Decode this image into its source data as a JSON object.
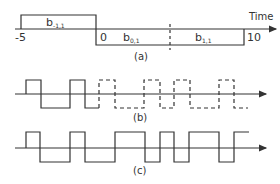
{
  "panel_a": {
    "caption": "(a)",
    "axis_label": "Time",
    "ticks": [
      {
        "label": "-5",
        "value": -5
      },
      {
        "label": "0",
        "value": 0
      },
      {
        "label": "10",
        "value": 10
      }
    ],
    "pulses": [
      {
        "name": "b",
        "sub": "-1,1",
        "level": "high",
        "from": -5,
        "to": 0
      },
      {
        "name": "b",
        "sub": "0,1",
        "level": "low",
        "from": 0,
        "to": 5
      },
      {
        "name": "b",
        "sub": "1,1",
        "level": "low",
        "from": 5,
        "to": 10
      }
    ],
    "dashed_marker_at": 5
  },
  "panel_b": {
    "caption": "(b)",
    "solid_bits": [
      1,
      0,
      1,
      0
    ],
    "dashed_bits": [
      1,
      0,
      1,
      0,
      1,
      0,
      1,
      0
    ]
  },
  "panel_c": {
    "caption": "(c)",
    "bits": [
      1,
      0,
      1,
      0,
      1,
      1,
      0,
      1,
      0,
      1,
      1,
      0,
      1
    ]
  },
  "colors": {
    "line": "#333333",
    "background": "#ffffff"
  }
}
